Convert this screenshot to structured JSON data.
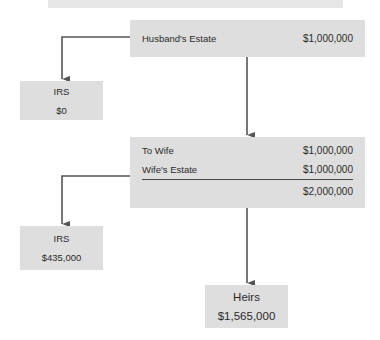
{
  "diagram": {
    "husband": {
      "label": "Husband's Estate",
      "value": "$1,000,000"
    },
    "irs1": {
      "label": "IRS",
      "value": "$0"
    },
    "wife": {
      "rows": [
        {
          "label": "To Wife",
          "value": "$1,000,000"
        },
        {
          "label": "Wife's Estate",
          "value": "$1,000,000"
        },
        {
          "label": "",
          "value": "$2,000,000"
        }
      ]
    },
    "irs2": {
      "label": "IRS",
      "value": "$435,000"
    },
    "heirs": {
      "label": "Heirs",
      "value": "$1,565,000"
    },
    "colors": {
      "box": "#dedede",
      "arrow": "#555555"
    }
  }
}
